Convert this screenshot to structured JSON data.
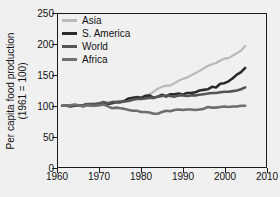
{
  "chart_data": {
    "type": "line",
    "title": "",
    "xlabel": "",
    "ylabel_line1": "Per capita food production",
    "ylabel_line2": "(1961 = 100)",
    "xlim": [
      1960,
      2010
    ],
    "ylim": [
      0,
      250
    ],
    "xticks": [
      1960,
      1970,
      1980,
      1990,
      2000,
      2010
    ],
    "yticks": [
      0,
      50,
      100,
      150,
      200,
      250
    ],
    "xtick_labels": [
      "1960",
      "1970",
      "1980",
      "1990",
      "2000",
      "2010"
    ],
    "ytick_labels": [
      "0",
      "50",
      "100",
      "150",
      "200",
      "250"
    ],
    "grid": false,
    "legend_position": "top-left",
    "x": [
      1961,
      1962,
      1963,
      1964,
      1965,
      1966,
      1967,
      1968,
      1969,
      1970,
      1971,
      1972,
      1973,
      1974,
      1975,
      1976,
      1977,
      1978,
      1979,
      1980,
      1981,
      1982,
      1983,
      1984,
      1985,
      1986,
      1987,
      1988,
      1989,
      1990,
      1991,
      1992,
      1993,
      1994,
      1995,
      1996,
      1997,
      1998,
      1999,
      2000,
      2001,
      2002,
      2003,
      2004,
      2005
    ],
    "series": [
      {
        "name": "Asia",
        "color": "#b9b9b9",
        "width": 2.2,
        "values": [
          100,
          100,
          100,
          101,
          100,
          100,
          102,
          103,
          104,
          105,
          107,
          104,
          107,
          106,
          108,
          108,
          110,
          113,
          115,
          114,
          117,
          119,
          123,
          128,
          131,
          133,
          133,
          137,
          141,
          144,
          146,
          150,
          153,
          157,
          161,
          165,
          168,
          170,
          174,
          177,
          178,
          182,
          186,
          190,
          198
        ]
      },
      {
        "name": "S. America",
        "color": "#2b2b2b",
        "width": 2.6,
        "values": [
          100,
          100,
          99,
          100,
          101,
          101,
          102,
          101,
          102,
          103,
          103,
          103,
          104,
          106,
          106,
          108,
          112,
          113,
          114,
          113,
          116,
          117,
          113,
          115,
          118,
          115,
          119,
          119,
          120,
          118,
          121,
          121,
          122,
          125,
          126,
          127,
          131,
          130,
          136,
          137,
          140,
          145,
          151,
          155,
          162
        ]
      },
      {
        "name": "World",
        "color": "#555555",
        "width": 2.6,
        "values": [
          100,
          100,
          100,
          101,
          100,
          101,
          103,
          103,
          103,
          104,
          106,
          104,
          106,
          106,
          106,
          107,
          108,
          110,
          111,
          111,
          112,
          113,
          113,
          115,
          116,
          117,
          116,
          115,
          117,
          117,
          116,
          117,
          117,
          118,
          119,
          120,
          121,
          121,
          122,
          123,
          123,
          124,
          125,
          127,
          130
        ]
      },
      {
        "name": "Africa",
        "color": "#6e6e6e",
        "width": 2.6,
        "values": [
          100,
          100,
          101,
          102,
          101,
          99,
          101,
          100,
          100,
          101,
          102,
          99,
          96,
          97,
          96,
          95,
          93,
          92,
          92,
          90,
          90,
          89,
          87,
          87,
          90,
          92,
          91,
          93,
          94,
          93,
          94,
          94,
          93,
          94,
          95,
          98,
          97,
          97,
          98,
          99,
          98,
          99,
          99,
          100,
          100
        ]
      }
    ],
    "legend": [
      {
        "label": "Asia",
        "color": "#b9b9b9"
      },
      {
        "label": "S. America",
        "color": "#2b2b2b"
      },
      {
        "label": "World",
        "color": "#555555"
      },
      {
        "label": "Africa",
        "color": "#6e6e6e"
      }
    ]
  },
  "figure": {
    "background": "#f0f0f0",
    "axis_color": "#1a1a1a",
    "text_color": "#111111"
  }
}
